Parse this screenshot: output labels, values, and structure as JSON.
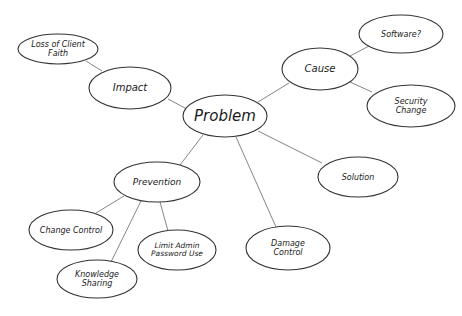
{
  "diagram": {
    "type": "mind-map",
    "style": "hand-drawn",
    "colors": {
      "background": "#ffffff",
      "stroke": "#333333",
      "edge": "#777777",
      "text": "#1a1a1a"
    },
    "nodes": [
      {
        "id": "problem",
        "label": [
          "Problem"
        ],
        "cx": 225,
        "cy": 116,
        "rx": 42,
        "ry": 21,
        "font_size": 15
      },
      {
        "id": "impact",
        "label": [
          "Impact"
        ],
        "cx": 130,
        "cy": 88,
        "rx": 41,
        "ry": 21,
        "font_size": 10
      },
      {
        "id": "loss-of-client-faith",
        "label": [
          "Loss of Client",
          "Faith"
        ],
        "cx": 58,
        "cy": 49,
        "rx": 40,
        "ry": 15,
        "font_size": 8
      },
      {
        "id": "cause",
        "label": [
          "Cause"
        ],
        "cx": 320,
        "cy": 69,
        "rx": 38,
        "ry": 21,
        "font_size": 10
      },
      {
        "id": "software",
        "label": [
          "Software?"
        ],
        "cx": 401,
        "cy": 34,
        "rx": 42,
        "ry": 19,
        "font_size": 8
      },
      {
        "id": "security-change",
        "label": [
          "Security",
          "Change"
        ],
        "cx": 411,
        "cy": 106,
        "rx": 44,
        "ry": 21,
        "font_size": 8
      },
      {
        "id": "prevention",
        "label": [
          "Prevention"
        ],
        "cx": 157,
        "cy": 182,
        "rx": 43,
        "ry": 20,
        "font_size": 9
      },
      {
        "id": "change-control",
        "label": [
          "Change Control"
        ],
        "cx": 71,
        "cy": 230,
        "rx": 42,
        "ry": 20,
        "font_size": 8
      },
      {
        "id": "limit-admin-password-use",
        "label": [
          "Limit Admin",
          "Password Use"
        ],
        "cx": 177,
        "cy": 250,
        "rx": 39,
        "ry": 20,
        "font_size": 7.5
      },
      {
        "id": "knowledge-sharing",
        "label": [
          "Knowledge",
          "Sharing"
        ],
        "cx": 97,
        "cy": 279,
        "rx": 40,
        "ry": 19,
        "font_size": 8
      },
      {
        "id": "solution",
        "label": [
          "Solution"
        ],
        "cx": 358,
        "cy": 177,
        "rx": 40,
        "ry": 20,
        "font_size": 8
      },
      {
        "id": "damage-control",
        "label": [
          "Damage",
          "Control"
        ],
        "cx": 288,
        "cy": 248,
        "rx": 42,
        "ry": 22,
        "font_size": 8
      }
    ],
    "edges": [
      {
        "from": "problem",
        "to": "impact",
        "x1": 185,
        "y1": 108,
        "x2": 168,
        "y2": 99
      },
      {
        "from": "impact",
        "to": "loss-of-client-faith",
        "x1": 102,
        "y1": 71,
        "x2": 86,
        "y2": 61
      },
      {
        "from": "problem",
        "to": "cause",
        "x1": 258,
        "y1": 102,
        "x2": 289,
        "y2": 83
      },
      {
        "from": "cause",
        "to": "software",
        "x1": 350,
        "y1": 56,
        "x2": 369,
        "y2": 46
      },
      {
        "from": "cause",
        "to": "security-change",
        "x1": 350,
        "y1": 82,
        "x2": 372,
        "y2": 92
      },
      {
        "from": "problem",
        "to": "prevention",
        "x1": 203,
        "y1": 135,
        "x2": 180,
        "y2": 165
      },
      {
        "from": "problem",
        "to": "solution",
        "x1": 258,
        "y1": 131,
        "x2": 322,
        "y2": 163
      },
      {
        "from": "problem",
        "to": "damage-control",
        "x1": 236,
        "y1": 137,
        "x2": 276,
        "y2": 227
      },
      {
        "from": "prevention",
        "to": "change-control",
        "x1": 124,
        "y1": 196,
        "x2": 96,
        "y2": 213
      },
      {
        "from": "prevention",
        "to": "knowledge-sharing",
        "x1": 141,
        "y1": 201,
        "x2": 111,
        "y2": 262
      },
      {
        "from": "prevention",
        "to": "limit-admin-password-use",
        "x1": 160,
        "y1": 202,
        "x2": 168,
        "y2": 231
      }
    ]
  }
}
